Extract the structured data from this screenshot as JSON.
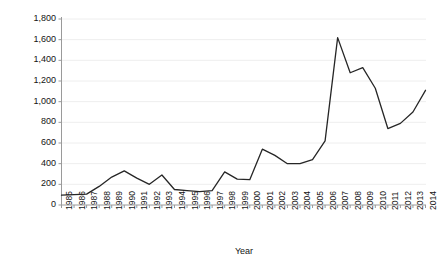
{
  "chart_data": {
    "type": "line",
    "title": "",
    "xlabel": "Year",
    "ylabel": "Number of stories",
    "grid": true,
    "legend": false,
    "xlim": [
      1985,
      2014
    ],
    "ylim": [
      0,
      1800
    ],
    "y_ticks": [
      0,
      200,
      400,
      600,
      800,
      1000,
      1200,
      1400,
      1600,
      1800
    ],
    "y_tick_labels": [
      "0",
      "200",
      "400",
      "600",
      "800",
      "1,000",
      "1,200",
      "1,400",
      "1,600",
      "1,800"
    ],
    "x": [
      1985,
      1986,
      1987,
      1988,
      1989,
      1990,
      1991,
      1992,
      1993,
      1994,
      1995,
      1996,
      1997,
      1998,
      1999,
      2000,
      2001,
      2002,
      2003,
      2004,
      2005,
      2006,
      2007,
      2008,
      2009,
      2010,
      2011,
      2012,
      2013,
      2014
    ],
    "x_tick_labels": [
      "1985",
      "1986",
      "1987",
      "1988",
      "1989",
      "1990",
      "1991",
      "1992",
      "1993",
      "1994",
      "1995",
      "1996",
      "1997",
      "1998",
      "1999",
      "2000",
      "2001",
      "2002",
      "2003",
      "2004",
      "2005",
      "2006",
      "2007",
      "2008",
      "2009",
      "2010",
      "2011",
      "2012",
      "2013",
      "2014"
    ],
    "categories": [
      "1985",
      "1986",
      "1987",
      "1988",
      "1989",
      "1990",
      "1991",
      "1992",
      "1993",
      "1994",
      "1995",
      "1996",
      "1997",
      "1998",
      "1999",
      "2000",
      "2001",
      "2002",
      "2003",
      "2004",
      "2005",
      "2006",
      "2007",
      "2008",
      "2009",
      "2010",
      "2011",
      "2012",
      "2013",
      "2014"
    ],
    "values": [
      95,
      100,
      105,
      180,
      270,
      330,
      260,
      200,
      290,
      150,
      140,
      130,
      140,
      320,
      250,
      245,
      540,
      480,
      400,
      400,
      440,
      620,
      1620,
      1280,
      1330,
      1130,
      740,
      790,
      900,
      1110
    ],
    "series": [
      {
        "name": "Number of stories",
        "color": "#262626",
        "values": [
          95,
          100,
          105,
          180,
          270,
          330,
          260,
          200,
          290,
          150,
          140,
          130,
          140,
          320,
          250,
          245,
          540,
          480,
          400,
          400,
          440,
          620,
          1620,
          1280,
          1330,
          1130,
          740,
          790,
          900,
          1110
        ]
      }
    ],
    "line_color": "#262626",
    "grid_color": "#eeeeee",
    "axis_color": "#9a9a9a"
  }
}
